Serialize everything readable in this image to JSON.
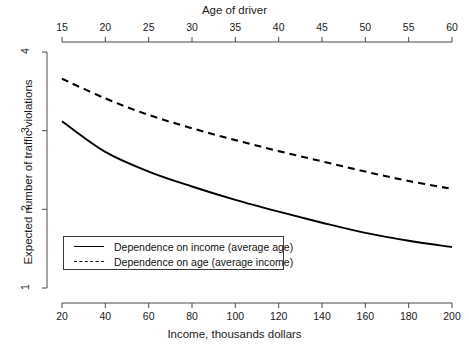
{
  "chart_data": {
    "type": "line",
    "title": "",
    "xlabel": "Income, thousands dollars",
    "ylabel": "Expected number of traffic violations",
    "top_axis_label": "Age of driver",
    "xlim": [
      20,
      200
    ],
    "ylim": [
      1,
      4
    ],
    "top_xlim": [
      15,
      60
    ],
    "xticks": [
      20,
      40,
      60,
      80,
      100,
      120,
      140,
      160,
      180,
      200
    ],
    "yticks": [
      1,
      2,
      3,
      4
    ],
    "top_xticks": [
      15,
      20,
      25,
      30,
      35,
      40,
      45,
      50,
      55,
      60
    ],
    "grid": false,
    "legend_position": "lower left",
    "series": [
      {
        "name": "Dependence on income (average age)",
        "style": "solid",
        "color": "#000000",
        "x": [
          20,
          40,
          60,
          80,
          100,
          120,
          140,
          160,
          180,
          200
        ],
        "values": [
          3.12,
          2.73,
          2.48,
          2.29,
          2.12,
          1.97,
          1.83,
          1.7,
          1.6,
          1.52
        ]
      },
      {
        "name": "Dependence on age (average income)",
        "style": "dashed",
        "color": "#000000",
        "x": [
          20,
          40,
          60,
          80,
          100,
          120,
          140,
          160,
          180,
          200
        ],
        "x_top": [
          15,
          20,
          25,
          30,
          35,
          40,
          45,
          50,
          55,
          60
        ],
        "values": [
          3.66,
          3.41,
          3.2,
          3.03,
          2.88,
          2.74,
          2.61,
          2.48,
          2.36,
          2.26
        ]
      }
    ]
  },
  "axes": {
    "top": {
      "title": "Age of driver",
      "ticks": [
        "15",
        "20",
        "25",
        "30",
        "35",
        "40",
        "45",
        "50",
        "55",
        "60"
      ]
    },
    "bottom": {
      "title": "Income, thousands dollars",
      "ticks": [
        "20",
        "40",
        "60",
        "80",
        "100",
        "120",
        "140",
        "160",
        "180",
        "200"
      ]
    },
    "left": {
      "title": "Expected number of traffic violations",
      "ticks": [
        "4",
        "3",
        "2",
        "1"
      ]
    }
  },
  "legend": {
    "entries": [
      {
        "label": "Dependence on income (average age)",
        "style": "solid"
      },
      {
        "label": "Dependence on age (average income)",
        "style": "dashed"
      }
    ]
  }
}
